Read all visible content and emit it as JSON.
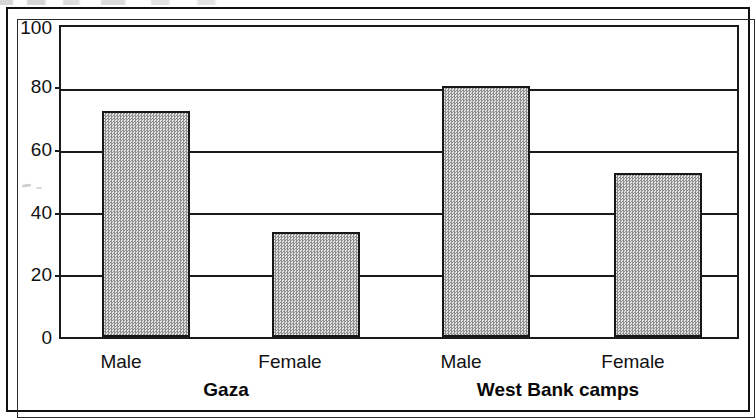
{
  "figure": {
    "frame_style": "double-rule-box",
    "background": "#ffffff",
    "ink_color": "#111111"
  },
  "chart_data": {
    "type": "bar",
    "title": "",
    "subtitle": "",
    "xlabel": "",
    "ylabel": "",
    "ylim": [
      0,
      100
    ],
    "yticks": [
      0,
      20,
      40,
      60,
      80,
      100
    ],
    "ytick_labels": [
      "0",
      "20",
      "40",
      "60",
      "80",
      "100"
    ],
    "grid": true,
    "grid_axis": "y",
    "legend": false,
    "legend_position": "none",
    "categories": [
      "Male",
      "Female",
      "Male",
      "Female"
    ],
    "values": [
      73,
      34,
      81,
      53
    ],
    "bar_fill_color": "#b6b6b6",
    "bar_edge_color": "#171717",
    "bar_fill_pattern": "checkerboard-dither",
    "groups": [
      {
        "label": "Gaza",
        "categories": [
          "Male",
          "Female"
        ],
        "values": [
          73,
          34
        ]
      },
      {
        "label": "West Bank camps",
        "categories": [
          "Male",
          "Female"
        ],
        "values": [
          81,
          53
        ]
      }
    ],
    "group_labels": [
      "Gaza",
      "West Bank camps"
    ],
    "series": [
      {
        "name": "value",
        "values": [
          73,
          34,
          81,
          53
        ]
      }
    ],
    "bars": [
      {
        "category": "Male",
        "group": "Gaza",
        "value": 73
      },
      {
        "category": "Female",
        "group": "Gaza",
        "value": 34
      },
      {
        "category": "Male",
        "group": "West Bank camps",
        "value": 81
      },
      {
        "category": "Female",
        "group": "West Bank camps",
        "value": 53
      }
    ]
  },
  "axis": {
    "y_tick_labels": [
      "100",
      "80",
      "60",
      "40",
      "20",
      "0"
    ]
  },
  "x_labels": {
    "items": [
      "Male",
      "Female",
      "Male",
      "Female"
    ]
  },
  "groups": {
    "items": [
      "Gaza",
      "West Bank camps"
    ]
  }
}
